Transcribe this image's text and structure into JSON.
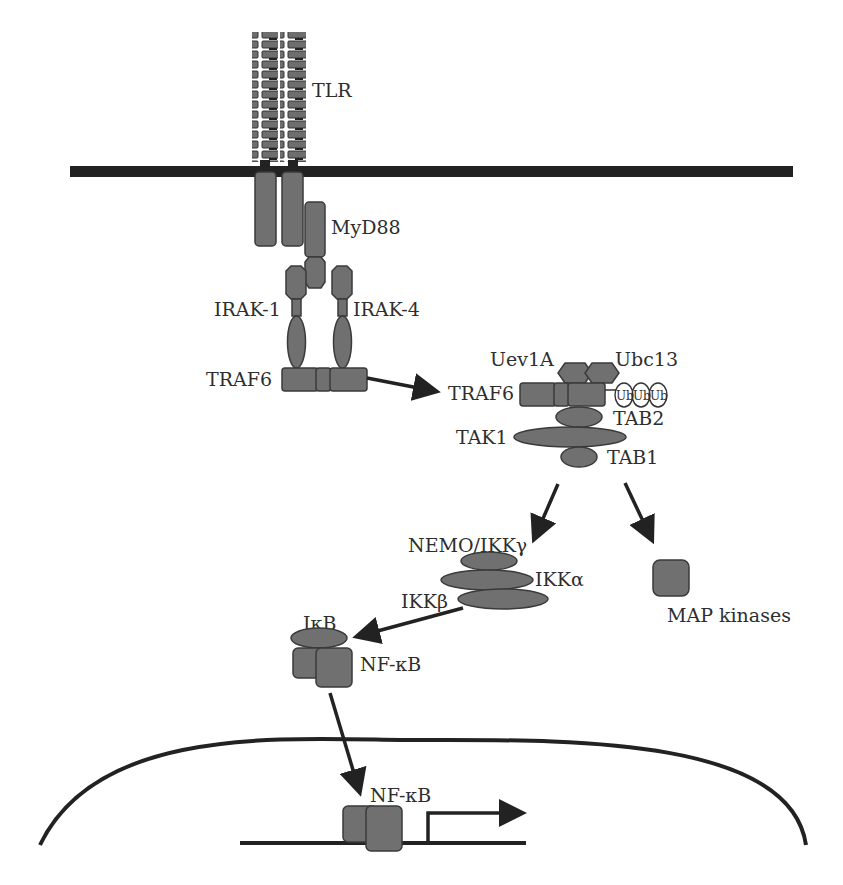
{
  "diagram": {
    "labels": {
      "tlr": "TLR",
      "myd88": "MyD88",
      "irak1": "IRAK-1",
      "irak4": "IRAK-4",
      "traf6_left": "TRAF6",
      "uev1a": "Uev1A",
      "ubc13": "Ubc13",
      "traf6_right": "TRAF6",
      "ub1": "Ub",
      "ub2": "Ub",
      "ub3": "Ub",
      "tab2": "TAB2",
      "tak1": "TAK1",
      "tab1": "TAB1",
      "nemo": "NEMO/IKKγ",
      "ikka": "IKKα",
      "ikkb": "IKKβ",
      "map_kinases": "MAP kinases",
      "ikb": "IκB",
      "nfkb_cyto": "NF-κB",
      "nfkb_nuc": "NF-κB"
    },
    "colors": {
      "protein_fill": "#707070",
      "protein_stroke": "#3a3a3a",
      "line": "#222222",
      "text": "#2e2e2e",
      "background": "#ffffff"
    },
    "edges": [
      {
        "from": "TRAF6 (receptor complex)",
        "to": "TRAF6 (Uev1A/Ubc13 complex)"
      },
      {
        "from": "TAK1 complex",
        "to": "IKK complex"
      },
      {
        "from": "TAK1 complex",
        "to": "MAP kinases"
      },
      {
        "from": "IKKβ",
        "to": "IκB"
      },
      {
        "from": "NF-κB (cytoplasm)",
        "to": "NF-κB (nucleus)"
      }
    ]
  }
}
